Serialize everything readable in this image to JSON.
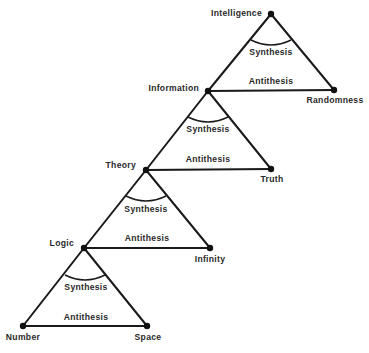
{
  "diagram": {
    "type": "dialectic-triangle-ladder",
    "background": "#ffffff",
    "line_color": "#1a1a1a",
    "nodes": [
      {
        "id": "intelligence",
        "label": "Intelligence",
        "x": 271,
        "y": 14,
        "label_x": 262,
        "label_y": 16,
        "anchor": "end"
      },
      {
        "id": "information",
        "label": "Information",
        "x": 208,
        "y": 91,
        "label_x": 199,
        "label_y": 91,
        "anchor": "end"
      },
      {
        "id": "randomness",
        "label": "Randomness",
        "x": 334,
        "y": 90,
        "label_x": 335,
        "label_y": 103,
        "anchor": "middle"
      },
      {
        "id": "theory",
        "label": "Theory",
        "x": 146,
        "y": 170,
        "label_x": 136,
        "label_y": 168,
        "anchor": "end"
      },
      {
        "id": "truth",
        "label": "Truth",
        "x": 271,
        "y": 169,
        "label_x": 272,
        "label_y": 182,
        "anchor": "middle"
      },
      {
        "id": "logic",
        "label": "Logic",
        "x": 84,
        "y": 248,
        "label_x": 74,
        "label_y": 246,
        "anchor": "end"
      },
      {
        "id": "infinity",
        "label": "Infinity",
        "x": 210,
        "y": 248,
        "label_x": 210,
        "label_y": 262,
        "anchor": "middle"
      },
      {
        "id": "number",
        "label": "Number",
        "x": 23,
        "y": 326,
        "label_x": 23,
        "label_y": 340,
        "anchor": "middle"
      },
      {
        "id": "space",
        "label": "Space",
        "x": 147,
        "y": 326,
        "label_x": 148,
        "label_y": 340,
        "anchor": "middle"
      }
    ],
    "triangles": [
      {
        "apex": "intelligence",
        "left": "information",
        "right": "randomness",
        "synthesis_label": "Synthesis",
        "antithesis_label": "Antithesis",
        "arc": {
          "x1": 251,
          "y1": 40,
          "cx": 271,
          "cy": 50,
          "x2": 291,
          "y2": 40
        },
        "synthesis_pos": [
          271,
          55
        ],
        "antithesis_pos": [
          271,
          84
        ]
      },
      {
        "apex": "information",
        "left": "theory",
        "right": "truth",
        "synthesis_label": "Synthesis",
        "antithesis_label": "Antithesis",
        "arc": {
          "x1": 188,
          "y1": 117,
          "cx": 208,
          "cy": 127,
          "x2": 228,
          "y2": 117
        },
        "synthesis_pos": [
          208,
          132
        ],
        "antithesis_pos": [
          208,
          162
        ]
      },
      {
        "apex": "theory",
        "left": "logic",
        "right": "infinity",
        "synthesis_label": "Synthesis",
        "antithesis_label": "Antithesis",
        "arc": {
          "x1": 126,
          "y1": 196,
          "cx": 146,
          "cy": 206,
          "x2": 166,
          "y2": 196
        },
        "synthesis_pos": [
          146,
          212
        ],
        "antithesis_pos": [
          147,
          241
        ]
      },
      {
        "apex": "logic",
        "left": "number",
        "right": "space",
        "synthesis_label": "Synthesis",
        "antithesis_label": "Antithesis",
        "arc": {
          "x1": 65,
          "y1": 275,
          "cx": 85,
          "cy": 285,
          "x2": 105,
          "y2": 275
        },
        "synthesis_pos": [
          86,
          290
        ],
        "antithesis_pos": [
          86,
          320
        ]
      }
    ]
  }
}
